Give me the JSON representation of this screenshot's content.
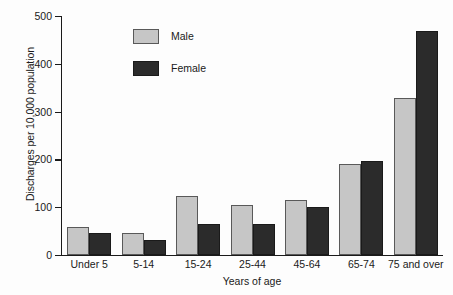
{
  "chart_data": {
    "type": "bar",
    "title": "",
    "subtitle": "",
    "xlabel": "Years of age",
    "ylabel": "Discharges per 10,000 population",
    "categories": [
      "Under 5",
      "5-14",
      "15-24",
      "25-44",
      "45-64",
      "65-74",
      "75 and over"
    ],
    "series": [
      {
        "name": "Male",
        "color": "#c6c6c6",
        "values": [
          58,
          47,
          123,
          105,
          115,
          190,
          328
        ]
      },
      {
        "name": "Female",
        "color": "#2b2b2b",
        "values": [
          47,
          32,
          65,
          65,
          101,
          197,
          469
        ]
      }
    ],
    "ylim": [
      0,
      500
    ],
    "yticks": [
      0,
      100,
      200,
      300,
      400,
      500
    ],
    "ytick_labels": [
      "0",
      "100",
      "200",
      "300",
      "400",
      "500"
    ],
    "grid": false,
    "legend_position": "upper-left-inside",
    "annotations": []
  }
}
